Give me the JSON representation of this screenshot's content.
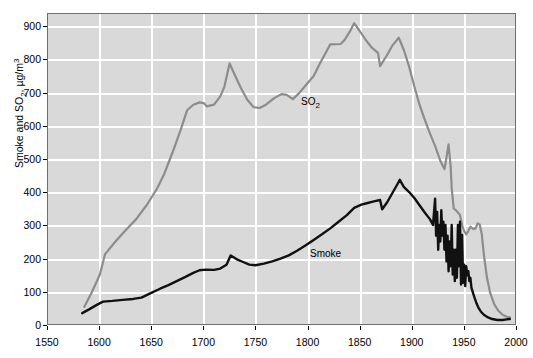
{
  "chart_data": {
    "type": "line",
    "title": "",
    "xlabel": "",
    "ylabel": "Smoke and SO2, µg/m3",
    "ylabel_parts": {
      "prefix": "Smoke and SO",
      "sub": "2",
      "mid": ", µg/m",
      "sup": "3"
    },
    "xlim": [
      1550,
      2000
    ],
    "ylim": [
      0,
      940
    ],
    "grid": true,
    "x_ticks": [
      1550,
      1600,
      1650,
      1700,
      1750,
      1800,
      1850,
      1900,
      1950,
      2000
    ],
    "y_ticks": [
      0,
      100,
      200,
      300,
      400,
      500,
      600,
      700,
      800,
      900
    ],
    "legend_position": "inline-annotations",
    "annotations": [
      {
        "name": "so2-label",
        "text": "SO2",
        "text_prefix": "SO",
        "text_sub": "2",
        "x": 1752,
        "y": 735
      },
      {
        "name": "smoke-label",
        "text": "Smoke",
        "x": 1760,
        "y": 268
      }
    ],
    "series": [
      {
        "name": "SO2",
        "color": "#8c8c8c",
        "points": [
          [
            1585,
            52
          ],
          [
            1592,
            95
          ],
          [
            1600,
            150
          ],
          [
            1605,
            212
          ],
          [
            1615,
            250
          ],
          [
            1625,
            285
          ],
          [
            1635,
            318
          ],
          [
            1645,
            360
          ],
          [
            1655,
            410
          ],
          [
            1662,
            455
          ],
          [
            1670,
            520
          ],
          [
            1678,
            590
          ],
          [
            1684,
            648
          ],
          [
            1690,
            665
          ],
          [
            1696,
            672
          ],
          [
            1700,
            670
          ],
          [
            1703,
            660
          ],
          [
            1710,
            665
          ],
          [
            1716,
            690
          ],
          [
            1720,
            720
          ],
          [
            1725,
            790
          ],
          [
            1730,
            755
          ],
          [
            1736,
            715
          ],
          [
            1742,
            680
          ],
          [
            1748,
            658
          ],
          [
            1754,
            655
          ],
          [
            1760,
            665
          ],
          [
            1768,
            685
          ],
          [
            1775,
            697
          ],
          [
            1780,
            695
          ],
          [
            1786,
            682
          ],
          [
            1792,
            700
          ],
          [
            1800,
            730
          ],
          [
            1806,
            752
          ],
          [
            1812,
            790
          ],
          [
            1818,
            825
          ],
          [
            1822,
            848
          ],
          [
            1832,
            849
          ],
          [
            1836,
            862
          ],
          [
            1841,
            888
          ],
          [
            1845,
            912
          ],
          [
            1850,
            890
          ],
          [
            1856,
            862
          ],
          [
            1862,
            838
          ],
          [
            1868,
            822
          ],
          [
            1870,
            782
          ],
          [
            1876,
            812
          ],
          [
            1882,
            845
          ],
          [
            1888,
            868
          ],
          [
            1893,
            830
          ],
          [
            1898,
            780
          ],
          [
            1903,
            720
          ],
          [
            1908,
            665
          ],
          [
            1913,
            620
          ],
          [
            1918,
            578
          ],
          [
            1923,
            540
          ],
          [
            1928,
            495
          ],
          [
            1932,
            470
          ],
          [
            1934,
            505
          ],
          [
            1936,
            545
          ],
          [
            1938,
            478
          ],
          [
            1939,
            412
          ],
          [
            1940,
            380
          ],
          [
            1941,
            350
          ],
          [
            1943,
            345
          ],
          [
            1945,
            338
          ],
          [
            1947,
            330
          ],
          [
            1949,
            300
          ],
          [
            1951,
            282
          ],
          [
            1953,
            272
          ],
          [
            1955,
            282
          ],
          [
            1957,
            295
          ],
          [
            1960,
            288
          ],
          [
            1962,
            290
          ],
          [
            1964,
            305
          ],
          [
            1966,
            302
          ],
          [
            1968,
            272
          ],
          [
            1970,
            210
          ],
          [
            1973,
            140
          ],
          [
            1976,
            95
          ],
          [
            1980,
            60
          ],
          [
            1984,
            40
          ],
          [
            1988,
            28
          ],
          [
            1992,
            22
          ],
          [
            1995,
            20
          ]
        ]
      },
      {
        "name": "Smoke",
        "color": "#111111",
        "points": [
          [
            1583,
            33
          ],
          [
            1590,
            45
          ],
          [
            1597,
            58
          ],
          [
            1603,
            68
          ],
          [
            1612,
            70
          ],
          [
            1622,
            73
          ],
          [
            1632,
            76
          ],
          [
            1640,
            80
          ],
          [
            1650,
            95
          ],
          [
            1658,
            107
          ],
          [
            1666,
            118
          ],
          [
            1674,
            130
          ],
          [
            1682,
            142
          ],
          [
            1690,
            155
          ],
          [
            1696,
            163
          ],
          [
            1702,
            165
          ],
          [
            1710,
            164
          ],
          [
            1716,
            168
          ],
          [
            1722,
            180
          ],
          [
            1726,
            208
          ],
          [
            1732,
            196
          ],
          [
            1738,
            188
          ],
          [
            1744,
            180
          ],
          [
            1750,
            178
          ],
          [
            1758,
            183
          ],
          [
            1766,
            190
          ],
          [
            1774,
            198
          ],
          [
            1782,
            208
          ],
          [
            1790,
            222
          ],
          [
            1798,
            238
          ],
          [
            1806,
            255
          ],
          [
            1814,
            272
          ],
          [
            1822,
            290
          ],
          [
            1830,
            310
          ],
          [
            1838,
            330
          ],
          [
            1845,
            352
          ],
          [
            1852,
            362
          ],
          [
            1858,
            367
          ],
          [
            1864,
            372
          ],
          [
            1870,
            376
          ],
          [
            1872,
            348
          ],
          [
            1877,
            370
          ],
          [
            1882,
            398
          ],
          [
            1886,
            420
          ],
          [
            1889,
            437
          ],
          [
            1893,
            415
          ],
          [
            1898,
            400
          ],
          [
            1903,
            382
          ],
          [
            1908,
            360
          ],
          [
            1913,
            338
          ],
          [
            1918,
            318
          ],
          [
            1921,
            300
          ],
          [
            1923,
            380
          ],
          [
            1924,
            268
          ],
          [
            1925,
            340
          ],
          [
            1926,
            225
          ],
          [
            1927,
            300
          ],
          [
            1928,
            250
          ],
          [
            1929,
            345
          ],
          [
            1930,
            268
          ],
          [
            1931,
            310
          ],
          [
            1932,
            225
          ],
          [
            1933,
            300
          ],
          [
            1934,
            190
          ],
          [
            1935,
            268
          ],
          [
            1936,
            160
          ],
          [
            1937,
            250
          ],
          [
            1938,
            175
          ],
          [
            1939,
            300
          ],
          [
            1940,
            150
          ],
          [
            1941,
            225
          ],
          [
            1942,
            130
          ],
          [
            1943,
            225
          ],
          [
            1944,
            140
          ],
          [
            1945,
            300
          ],
          [
            1946,
            175
          ],
          [
            1947,
            310
          ],
          [
            1948,
            120
          ],
          [
            1949,
            270
          ],
          [
            1950,
            125
          ],
          [
            1951,
            180
          ],
          [
            1952,
            115
          ],
          [
            1953,
            175
          ],
          [
            1954,
            148
          ],
          [
            1955,
            160
          ],
          [
            1956,
            130
          ],
          [
            1957,
            140
          ],
          [
            1958,
            110
          ],
          [
            1959,
            100
          ],
          [
            1961,
            80
          ],
          [
            1963,
            62
          ],
          [
            1965,
            48
          ],
          [
            1967,
            38
          ],
          [
            1970,
            28
          ],
          [
            1974,
            20
          ],
          [
            1978,
            15
          ],
          [
            1983,
            12
          ],
          [
            1988,
            12
          ],
          [
            1992,
            14
          ],
          [
            1995,
            15
          ]
        ]
      }
    ]
  }
}
